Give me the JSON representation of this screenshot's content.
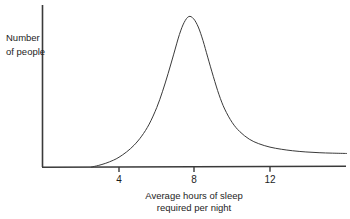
{
  "chart_data": {
    "type": "line",
    "title": "",
    "xlabel": "Average hours of sleep required per night",
    "xlabel_lines": [
      "Average hours of sleep",
      "required per night"
    ],
    "ylabel": "Number of people",
    "ylabel_lines": [
      "Number",
      "of people"
    ],
    "xlim": [
      0,
      16.1
    ],
    "ylim": [
      0,
      1.05
    ],
    "xticks": [
      4,
      8,
      12
    ],
    "xtick_labels": [
      "4",
      "8",
      "12"
    ],
    "yticks": [],
    "ytick_labels": [],
    "grid": false,
    "legend": null,
    "legend_position": "none",
    "annotations": [],
    "series": [
      {
        "name": "Number of people",
        "color": "#3a3a3a",
        "line_width": 1,
        "x": [
          2.55,
          2.9,
          3.3,
          3.7,
          4.0,
          4.4,
          4.8,
          5.2,
          5.6,
          6.0,
          6.3,
          6.6,
          6.9,
          7.2,
          7.45,
          7.7,
          7.95,
          8.2,
          8.45,
          8.7,
          9.0,
          9.3,
          9.6,
          10.0,
          10.4,
          10.9,
          11.4,
          12.0,
          12.6,
          13.2,
          13.9,
          14.6,
          15.3,
          16.05
        ],
        "y": [
          0.0,
          0.01,
          0.025,
          0.045,
          0.065,
          0.1,
          0.145,
          0.205,
          0.285,
          0.395,
          0.5,
          0.62,
          0.75,
          0.88,
          0.96,
          1.0,
          0.985,
          0.93,
          0.84,
          0.73,
          0.6,
          0.48,
          0.385,
          0.295,
          0.235,
          0.185,
          0.155,
          0.132,
          0.118,
          0.108,
          0.1,
          0.095,
          0.092,
          0.09
        ]
      }
    ],
    "peak_x": 7.7,
    "peak_y": 1.0,
    "axis_color": "#3a3a3a",
    "background_color": "#ffffff"
  },
  "labels": {
    "y_axis_line1": "Number",
    "y_axis_line2": "of people",
    "x_axis_line1": "Average hours of sleep",
    "x_axis_line2": "required per night",
    "tick_4": "4",
    "tick_8": "8",
    "tick_12": "12"
  }
}
